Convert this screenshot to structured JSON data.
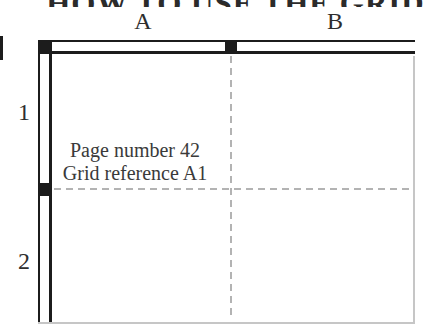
{
  "title": {
    "text": "HOW TO USE THE GRID",
    "note": "cropped at top of image, only letter bottoms visible"
  },
  "grid": {
    "column_labels": [
      "A",
      "B"
    ],
    "row_labels": [
      "1",
      "2"
    ],
    "annotation": {
      "line1": "Page number 42",
      "line2": "Grid reference A1"
    }
  },
  "colors": {
    "line": "#1c1c1c",
    "dashed_line": "#b3b3b3",
    "page_edge": "#c6c6c6",
    "text": "#3a3a3a",
    "background": "#ffffff"
  }
}
